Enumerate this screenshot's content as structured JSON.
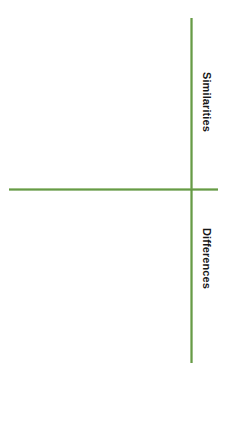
{
  "document": {
    "title": "Similarities and Differences Organizer",
    "background_color": "#ffffff",
    "orientation": "rotated-90-clockwise"
  },
  "chart_data": {
    "type": "table",
    "title": "",
    "subtitle": "",
    "xlabel": "",
    "ylabel": "",
    "grid": false,
    "legend": null,
    "categories": [
      "Similarities",
      "Differences"
    ],
    "values": [
      0,
      0
    ],
    "annotations": []
  },
  "organizer": {
    "axes": {
      "vertical": {
        "name": "vertical-divider",
        "color": "#6fa24c",
        "thickness_px": 3,
        "start_px": 18,
        "end_px": 363,
        "position_px": 191
      },
      "horizontal": {
        "name": "horizontal-divider",
        "color": "#6fa24c",
        "thickness_px": 3,
        "start_px": 9,
        "end_px": 218,
        "position_px": 189
      },
      "intersection_px": [
        191,
        189
      ]
    },
    "sections": [
      {
        "id": "similarities",
        "label": "Similarities",
        "text_color": "#171717",
        "content": ""
      },
      {
        "id": "differences",
        "label": "Differences",
        "text_color": "#171717",
        "content": ""
      }
    ]
  },
  "colors": {
    "accent_green": "#6fa24c",
    "accent_green_dark": "#5e9440",
    "text": "#171717",
    "background": "#ffffff"
  }
}
